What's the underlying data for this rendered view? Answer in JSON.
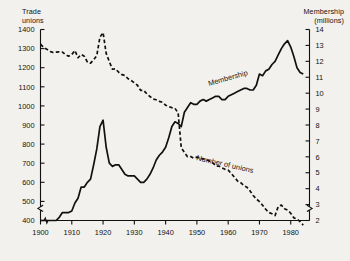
{
  "figure": {
    "background_color": "#f2f1ee",
    "ink_color": "#111111"
  },
  "axes": {
    "left_title": "Trade\nunions",
    "right_title": "Membership\n(millions)",
    "left_ticks": [
      1400,
      1300,
      1200,
      1100,
      1000,
      900,
      800,
      700,
      600,
      500,
      400
    ],
    "right_ticks": [
      14,
      13,
      12,
      11,
      10,
      9,
      8,
      7,
      6,
      5,
      4,
      3,
      2
    ],
    "x_ticks": [
      1900,
      1910,
      1920,
      1930,
      1940,
      1950,
      1960,
      1970,
      1980
    ],
    "axis_break_left": true,
    "axis_break_right": true,
    "axis_break_x": true
  },
  "chart_data": {
    "type": "line",
    "title": "",
    "subtitle": "",
    "xlabel": "",
    "ylabel": "Trade unions",
    "y2label": "Membership (millions)",
    "xlim": [
      1900,
      1986
    ],
    "ylim": [
      400,
      1400
    ],
    "y2lim": [
      2,
      14
    ],
    "grid": false,
    "legend": "inline-labels",
    "series": [
      {
        "name": "Number of unions",
        "axis": "left",
        "style": "dashed",
        "units": "unions",
        "label_position": "inline-mid-right",
        "x": [
          1900,
          1901,
          1902,
          1903,
          1904,
          1905,
          1906,
          1907,
          1908,
          1909,
          1910,
          1911,
          1912,
          1913,
          1914,
          1915,
          1916,
          1917,
          1918,
          1919,
          1920,
          1921,
          1922,
          1923,
          1924,
          1925,
          1926,
          1927,
          1928,
          1929,
          1930,
          1931,
          1932,
          1933,
          1934,
          1935,
          1936,
          1937,
          1938,
          1939,
          1940,
          1941,
          1942,
          1943,
          1944,
          1945,
          1946,
          1947,
          1948,
          1949,
          1950,
          1951,
          1952,
          1953,
          1954,
          1955,
          1956,
          1957,
          1958,
          1959,
          1960,
          1961,
          1962,
          1963,
          1964,
          1965,
          1966,
          1967,
          1968,
          1969,
          1970,
          1971,
          1972,
          1973,
          1974,
          1975,
          1976,
          1977,
          1978,
          1979,
          1980,
          1981,
          1982,
          1983,
          1984
        ],
        "values": [
          1323,
          1306,
          1297,
          1285,
          1280,
          1282,
          1283,
          1282,
          1268,
          1260,
          1269,
          1290,
          1252,
          1269,
          1260,
          1229,
          1224,
          1241,
          1264,
          1360,
          1384,
          1275,
          1232,
          1192,
          1194,
          1176,
          1164,
          1159,
          1142,
          1133,
          1121,
          1108,
          1081,
          1081,
          1063,
          1049,
          1036,
          1032,
          1024,
          1019,
          1004,
          996,
          991,
          987,
          963,
          781,
          757,
          734,
          735,
          726,
          732,
          724,
          723,
          719,
          711,
          704,
          685,
          685,
          675,
          668,
          664,
          646,
          626,
          607,
          598,
          583,
          574,
          555,
          531,
          513,
          499,
          480,
          459,
          442,
          435,
          426,
          473,
          481,
          462,
          454,
          438,
          414,
          408,
          394,
          376
        ]
      },
      {
        "name": "Membership",
        "axis": "right",
        "style": "solid",
        "units": "millions",
        "label_position": "inline-mid-right",
        "x": [
          1900,
          1901,
          1902,
          1903,
          1904,
          1905,
          1906,
          1907,
          1908,
          1909,
          1910,
          1911,
          1912,
          1913,
          1914,
          1915,
          1916,
          1917,
          1918,
          1919,
          1920,
          1921,
          1922,
          1923,
          1924,
          1925,
          1926,
          1927,
          1928,
          1929,
          1930,
          1931,
          1932,
          1933,
          1934,
          1935,
          1936,
          1937,
          1938,
          1939,
          1940,
          1941,
          1942,
          1943,
          1944,
          1945,
          1946,
          1947,
          1948,
          1949,
          1950,
          1951,
          1952,
          1953,
          1954,
          1955,
          1956,
          1957,
          1958,
          1959,
          1960,
          1961,
          1962,
          1963,
          1964,
          1965,
          1966,
          1967,
          1968,
          1969,
          1970,
          1971,
          1972,
          1973,
          1974,
          1975,
          1976,
          1977,
          1978,
          1979,
          1980,
          1981,
          1982,
          1983,
          1984
        ],
        "values": [
          2.0,
          2.0,
          2.0,
          2.0,
          2.0,
          2.0,
          2.2,
          2.5,
          2.5,
          2.5,
          2.6,
          3.1,
          3.4,
          4.1,
          4.1,
          4.4,
          4.6,
          5.5,
          6.5,
          7.9,
          8.3,
          6.6,
          5.6,
          5.4,
          5.5,
          5.5,
          5.2,
          4.9,
          4.8,
          4.8,
          4.8,
          4.6,
          4.4,
          4.4,
          4.6,
          4.9,
          5.3,
          5.8,
          6.1,
          6.3,
          6.6,
          7.2,
          7.9,
          8.2,
          8.1,
          7.9,
          8.8,
          9.1,
          9.4,
          9.3,
          9.3,
          9.5,
          9.6,
          9.5,
          9.6,
          9.7,
          9.8,
          9.8,
          9.6,
          9.6,
          9.8,
          9.9,
          10.0,
          10.1,
          10.2,
          10.3,
          10.3,
          10.2,
          10.2,
          10.5,
          11.2,
          11.1,
          11.4,
          11.5,
          11.8,
          12.0,
          12.4,
          12.8,
          13.1,
          13.3,
          12.9,
          12.3,
          11.6,
          11.3,
          11.2
        ]
      }
    ]
  },
  "series_labels": {
    "membership": "Membership",
    "number_of_unions": "Number of unions"
  }
}
